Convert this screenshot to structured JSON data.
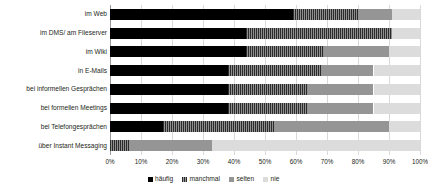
{
  "chart_data": {
    "type": "bar",
    "orientation": "horizontal",
    "stacked": true,
    "normalized": true,
    "title": "",
    "subtitle": "",
    "xlabel": "",
    "ylabel": "",
    "xlim": [
      0,
      100
    ],
    "x_tick_labels": [
      "0%",
      "10%",
      "20%",
      "30%",
      "40%",
      "50%",
      "60%",
      "70%",
      "80%",
      "90%",
      "100%"
    ],
    "x_tick_values": [
      0,
      10,
      20,
      30,
      40,
      50,
      60,
      70,
      80,
      90,
      100
    ],
    "grid": true,
    "grid_axis": "x",
    "legend_position": "bottom",
    "legend": [
      "häufig",
      "manchmal",
      "selten",
      "nie"
    ],
    "categories": [
      "im Web",
      "im DMS/ am Fileserver",
      "im Wiki",
      "in E-Mails",
      "bei informellen Gesprächen",
      "bei formellen Meetings",
      "bei Telefongesprächen",
      "über Instant Messaging"
    ],
    "series": [
      {
        "name": "häufig",
        "color": "#000000",
        "values": [
          59,
          44,
          44,
          38,
          38,
          38,
          17,
          0
        ]
      },
      {
        "name": "manchmal",
        "color": "#575757",
        "values": [
          21,
          47,
          25,
          30,
          26,
          26,
          36,
          6
        ]
      },
      {
        "name": "selten",
        "color": "#959595",
        "values": [
          11,
          0,
          21,
          17,
          21,
          21,
          37,
          27
        ]
      },
      {
        "name": "nie",
        "color": "#dcdcdc",
        "values": [
          9,
          9,
          10,
          15,
          15,
          15,
          10,
          67
        ]
      }
    ]
  }
}
